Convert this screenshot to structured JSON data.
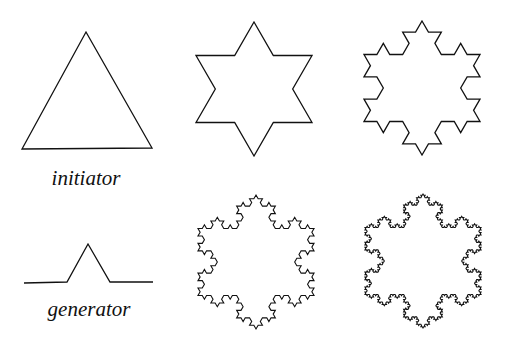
{
  "figure": {
    "labels": {
      "initiator": "initiator",
      "generator": "generator"
    },
    "stroke_color": "#111111",
    "background": "#ffffff",
    "panels": [
      {
        "name": "initiator",
        "type": "triangle",
        "level": 0
      },
      {
        "name": "level-1",
        "type": "koch-snowflake",
        "level": 1
      },
      {
        "name": "level-2",
        "type": "koch-snowflake",
        "level": 2
      },
      {
        "name": "generator",
        "type": "koch-generator"
      },
      {
        "name": "level-3",
        "type": "koch-snowflake",
        "level": 3
      },
      {
        "name": "level-4",
        "type": "koch-snowflake",
        "level": 4
      }
    ]
  }
}
